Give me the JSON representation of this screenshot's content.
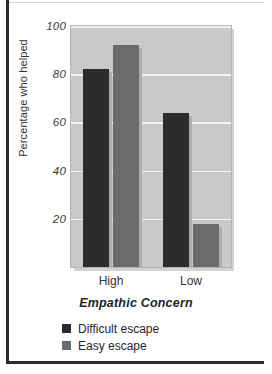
{
  "chart_data": {
    "type": "bar",
    "title": "",
    "subtitle": "",
    "xlabel": "Empathic Concern",
    "ylabel": "Percentage who helped",
    "categories": [
      "High",
      "Low"
    ],
    "series": [
      {
        "name": "Difficult escape",
        "values": [
          82,
          64
        ],
        "color": "#2b2b2b"
      },
      {
        "name": "Easy escape",
        "values": [
          92,
          18
        ],
        "color": "#6b6b6b"
      }
    ],
    "ylim": [
      0,
      100
    ],
    "yticks": [
      20,
      40,
      60,
      80,
      100
    ],
    "ytick_labels": [
      "20",
      "40",
      "60",
      "80",
      "100"
    ],
    "grid": "horizontal",
    "gridline_color": "#f2f2f2",
    "plot_background": "#c9c9c9",
    "figure_background": "#ffffff",
    "legend_position": "below-axis-left"
  },
  "legend": {
    "items": [
      {
        "label": "Difficult escape",
        "color": "#2b2b2b"
      },
      {
        "label": "Easy escape",
        "color": "#6b6b6b"
      }
    ]
  },
  "axes": {
    "y_title": "Percentage who helped",
    "x_title": "Empathic Concern",
    "y_ticks": [
      "20",
      "40",
      "60",
      "80",
      "100"
    ],
    "x_ticks": [
      "High",
      "Low"
    ]
  }
}
